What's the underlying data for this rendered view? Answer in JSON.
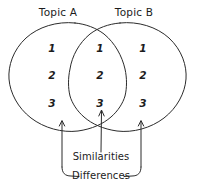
{
  "diagram": {
    "type": "venn-diagram",
    "style": "hand-drawn",
    "stroke_color": "#2b2b2b",
    "text_color": "#1c1c1c",
    "background_color": "#ffffff",
    "circles": [
      {
        "name": "Topic A",
        "label": "Topic A"
      },
      {
        "name": "Topic B",
        "label": "Topic B"
      }
    ],
    "regions": {
      "left_only": {
        "label": "Topic A",
        "items": [
          "1",
          "2",
          "3"
        ]
      },
      "overlap": {
        "label": "Similarities",
        "items": [
          "1",
          "2",
          "3"
        ]
      },
      "right_only": {
        "label": "Topic B",
        "items": [
          "1",
          "2",
          "3"
        ]
      }
    },
    "annotations": {
      "similarities": "Similarities",
      "differences": "Differences"
    }
  }
}
